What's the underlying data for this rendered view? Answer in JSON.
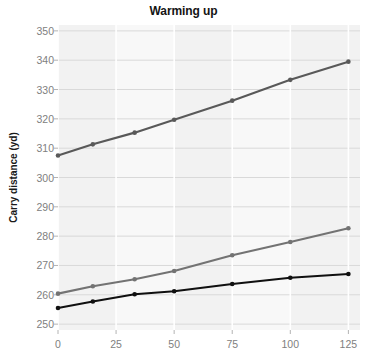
{
  "chart_data": {
    "type": "line",
    "title": "Warming up",
    "xlabel": "",
    "ylabel": "Carry distance (yd)",
    "xlim": [
      0,
      130
    ],
    "ylim": [
      248,
      352
    ],
    "xticks": [
      0,
      25,
      50,
      75,
      100,
      125
    ],
    "yticks": [
      250,
      260,
      270,
      280,
      290,
      300,
      310,
      320,
      330,
      340,
      350
    ],
    "grid": true,
    "legend": "none",
    "x": [
      0,
      15,
      33,
      50,
      75,
      100,
      125
    ],
    "series": [
      {
        "name": "series-top",
        "color": "#595959",
        "values": [
          307.5,
          311.3,
          315.3,
          319.7,
          326.2,
          333.3,
          339.5
        ]
      },
      {
        "name": "series-middle",
        "color": "#737373",
        "values": [
          260.4,
          262.9,
          265.3,
          268.1,
          273.5,
          278.0,
          282.7
        ]
      },
      {
        "name": "series-bottom",
        "color": "#101010",
        "values": [
          255.5,
          257.7,
          260.2,
          261.2,
          263.7,
          265.8,
          267.1
        ]
      }
    ]
  },
  "labels": {
    "title": "Warming up",
    "ylabel": "Carry distance (yd)",
    "ytick_texts": [
      "250",
      "260",
      "270",
      "280",
      "290",
      "300",
      "310",
      "320",
      "330",
      "340",
      "350"
    ],
    "xtick_texts": [
      "0",
      "25",
      "50",
      "75",
      "100",
      "125"
    ]
  }
}
